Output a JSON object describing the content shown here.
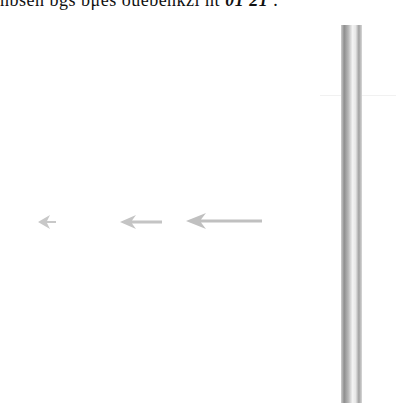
{
  "header": {
    "clipped_text": "nbsen bgs bμes ouebenkzl nt ",
    "clipped_text_bold": "01 21",
    "trailing_mark": "  ."
  },
  "arrows": [
    {
      "id": "arrow-small",
      "direction": "left",
      "x": 36,
      "y": 214,
      "length": 20,
      "color": "#c8c8c8"
    },
    {
      "id": "arrow-medium",
      "direction": "left",
      "x": 120,
      "y": 214,
      "length": 42,
      "color": "#c4c4c4"
    },
    {
      "id": "arrow-large",
      "direction": "left",
      "x": 186,
      "y": 212,
      "length": 76,
      "color": "#c0c0c0"
    }
  ],
  "vertical_bar": {
    "color_dark": "#8e8e8e",
    "color_light": "#f4f4f4"
  }
}
